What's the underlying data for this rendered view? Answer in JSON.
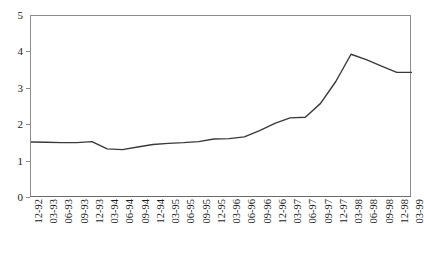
{
  "chart_data": {
    "type": "line",
    "title": "",
    "subtitle": "",
    "xlabel": "",
    "ylabel": "",
    "ylim": [
      0,
      5
    ],
    "yticks": [
      0,
      1,
      2,
      3,
      4,
      5
    ],
    "grid": false,
    "legend": false,
    "line_color": "#3a3a3a",
    "axis_color": "#8c8c8c",
    "categories": [
      "12-92",
      "03-93",
      "06-93",
      "09-93",
      "12-93",
      "03-94",
      "06-94",
      "09-94",
      "12-94",
      "03-95",
      "06-95",
      "09-95",
      "12-95",
      "03-96",
      "06-96",
      "09-96",
      "12-96",
      "03-97",
      "06-97",
      "09-97",
      "12-97",
      "03-98",
      "06-98",
      "09-98",
      "12-98",
      "03-99"
    ],
    "values": [
      1.54,
      1.53,
      1.52,
      1.52,
      1.55,
      1.35,
      1.33,
      1.4,
      1.47,
      1.5,
      1.52,
      1.55,
      1.62,
      1.63,
      1.68,
      1.85,
      2.05,
      2.2,
      2.22,
      2.6,
      3.2,
      3.95,
      3.8,
      3.62,
      3.45,
      3.45
    ],
    "series": [
      {
        "name": "series-1",
        "values": [
          1.54,
          1.53,
          1.52,
          1.52,
          1.55,
          1.35,
          1.33,
          1.4,
          1.47,
          1.5,
          1.52,
          1.55,
          1.62,
          1.63,
          1.68,
          1.85,
          2.05,
          2.2,
          2.22,
          2.6,
          3.2,
          3.95,
          3.8,
          3.62,
          3.45,
          3.45
        ]
      }
    ]
  }
}
